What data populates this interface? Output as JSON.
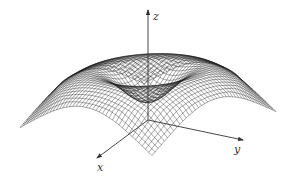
{
  "figure": {
    "type": "3d-surface-mesh",
    "background": "#ffffff",
    "mesh_color": "#1a1a1a",
    "axis_color": "#333333"
  },
  "axes": {
    "x": {
      "label": "x"
    },
    "y": {
      "label": "y"
    },
    "z": {
      "label": "z"
    }
  },
  "chart_data": {
    "type": "surface",
    "title": "",
    "xlabel": "x",
    "ylabel": "y",
    "zlabel": "z",
    "domain": {
      "x": [
        -1,
        1
      ],
      "y": [
        -1,
        1
      ]
    },
    "grid_lines": 40,
    "surface": "z = r^2 * exp(1 - r^2) style profile (volcano with central crater), corners dip downward",
    "grid": false,
    "legend": null
  }
}
